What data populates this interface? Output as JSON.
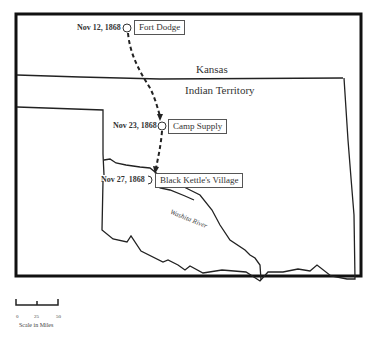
{
  "map": {
    "regions": {
      "north": "Kansas",
      "south": "Indian Territory"
    },
    "river": "Washita River",
    "locations": [
      {
        "name": "Fort Dodge",
        "date": "Nov 12, 1868"
      },
      {
        "name": "Camp Supply",
        "date": "Nov 23, 1868"
      },
      {
        "name": "Black Kettle's Village",
        "date": "Nov 27, 1868"
      }
    ],
    "scale": {
      "ticks": [
        "0",
        "25",
        "50"
      ],
      "title": "Scale in Miles"
    },
    "colors": {
      "line": "#222222",
      "border": "#111111",
      "background": "#ffffff"
    }
  }
}
